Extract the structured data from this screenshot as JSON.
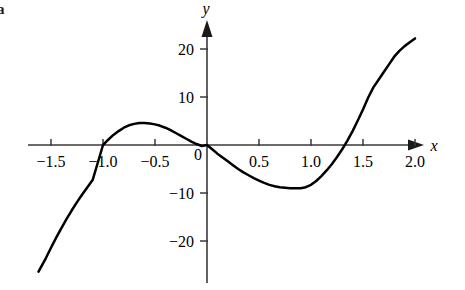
{
  "panel": {
    "label": "a"
  },
  "axes": {
    "x_name": "x",
    "y_name": "y",
    "x_ticks": [
      {
        "value": -1.5,
        "label": "−1.5"
      },
      {
        "value": -1.0,
        "label": "−1.0"
      },
      {
        "value": -0.5,
        "label": "−0.5"
      },
      {
        "value": 0.0,
        "label": "0"
      },
      {
        "value": 0.5,
        "label": "0.5"
      },
      {
        "value": 1.0,
        "label": "1.0"
      },
      {
        "value": 1.5,
        "label": "1.5"
      },
      {
        "value": 2.0,
        "label": "2.0"
      }
    ],
    "y_ticks": [
      {
        "value": 20,
        "label": "20"
      },
      {
        "value": 10,
        "label": "10"
      },
      {
        "value": -10,
        "label": "−10"
      },
      {
        "value": -20,
        "label": "−20"
      }
    ]
  },
  "chart_data": {
    "type": "line",
    "title": "",
    "subtitle": "",
    "xlabel": "x",
    "ylabel": "y",
    "xlim": [
      -1.62,
      2.05
    ],
    "ylim": [
      -27,
      23
    ],
    "grid": false,
    "legend": null,
    "curve_color": "#000000",
    "axis_color": "#3a3a3a",
    "x_tick_values": [
      -1.5,
      -1.0,
      -0.5,
      0.0,
      0.5,
      1.0,
      1.5,
      2.0
    ],
    "y_tick_values": [
      20,
      10,
      -10,
      -20
    ],
    "roots": [
      -1.0,
      0.0,
      1.5
    ],
    "local_maximum": {
      "x": -0.55,
      "y": 4.5
    },
    "local_minimum": {
      "x": 0.92,
      "y": -9.0
    },
    "series": [
      {
        "name": "cubic",
        "x": [
          -1.62,
          -1.55,
          -1.5,
          -1.45,
          -1.4,
          -1.35,
          -1.3,
          -1.25,
          -1.2,
          -1.15,
          -1.1,
          -1.05,
          -1.0,
          -0.95,
          -0.9,
          -0.85,
          -0.8,
          -0.75,
          -0.7,
          -0.65,
          -0.6,
          -0.55,
          -0.5,
          -0.45,
          -0.4,
          -0.35,
          -0.3,
          -0.25,
          -0.2,
          -0.15,
          -0.1,
          -0.05,
          0.0,
          0.05,
          0.1,
          0.15,
          0.2,
          0.25,
          0.3,
          0.35,
          0.4,
          0.45,
          0.5,
          0.55,
          0.6,
          0.65,
          0.7,
          0.75,
          0.8,
          0.85,
          0.9,
          0.95,
          1.0,
          1.05,
          1.1,
          1.15,
          1.2,
          1.25,
          1.3,
          1.35,
          1.4,
          1.45,
          1.5,
          1.55,
          1.6,
          1.65,
          1.7,
          1.75,
          1.8,
          1.85,
          1.9,
          1.95,
          2.0
        ],
        "y": [
          -26.4,
          -23.6,
          -21.4,
          -19.3,
          -17.3,
          -15.4,
          -13.6,
          -11.9,
          -10.3,
          -8.8,
          -7.3,
          -3.7,
          0.0,
          1.1,
          2.1,
          2.9,
          3.6,
          4.1,
          4.4,
          4.6,
          4.6,
          4.5,
          4.3,
          4.0,
          3.6,
          3.1,
          2.5,
          1.9,
          1.3,
          0.7,
          0.2,
          -0.2,
          0.0,
          -0.9,
          -1.8,
          -2.6,
          -3.4,
          -4.2,
          -5.0,
          -5.7,
          -6.3,
          -6.9,
          -7.4,
          -7.9,
          -8.3,
          -8.6,
          -8.8,
          -8.9,
          -9.0,
          -9.0,
          -9.0,
          -8.8,
          -8.3,
          -7.5,
          -6.5,
          -5.3,
          -4.0,
          -2.5,
          -0.9,
          0.9,
          2.9,
          5.1,
          7.4,
          9.9,
          12.0,
          13.6,
          15.2,
          16.8,
          18.4,
          19.6,
          20.6,
          21.4,
          22.2
        ]
      }
    ]
  }
}
